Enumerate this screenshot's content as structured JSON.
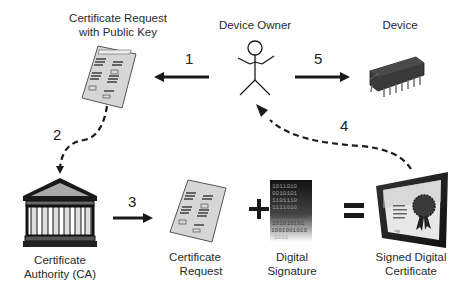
{
  "diagram": {
    "nodes": {
      "cert_request_pubkey": {
        "label_line1": "Certificate Request",
        "label_line2": "with Public Key",
        "icon": "document-form-icon"
      },
      "device_owner": {
        "label": "Device Owner",
        "icon": "stick-figure-icon"
      },
      "device": {
        "label": "Device",
        "icon": "microchip-icon"
      },
      "ca": {
        "label_line1": "Certificate",
        "label_line2": "Authority (CA)",
        "icon": "bank-building-icon"
      },
      "cert_request": {
        "label_line1": "Certificate",
        "label_line2": "Request",
        "icon": "document-form-icon"
      },
      "digital_signature": {
        "label_line1": "Digital",
        "label_line2": "Signature",
        "icon": "binary-data-icon"
      },
      "signed_cert": {
        "label_line1": "Signed Digital",
        "label_line2": "Certificate",
        "icon": "framed-certificate-icon"
      }
    },
    "steps": [
      {
        "number": "1",
        "from": "Device Owner",
        "to": "Certificate Request with Public Key",
        "style": "solid"
      },
      {
        "number": "2",
        "from": "Certificate Request with Public Key",
        "to": "Certificate Authority (CA)",
        "style": "dashed"
      },
      {
        "number": "3",
        "from": "Certificate Authority (CA)",
        "to": "Certificate Request",
        "style": "solid"
      },
      {
        "number": "4",
        "from": "Signed Digital Certificate",
        "to": "Device Owner",
        "style": "dashed"
      },
      {
        "number": "5",
        "from": "Device Owner",
        "to": "Device",
        "style": "solid"
      }
    ],
    "operators": {
      "plus": "+",
      "equals": "="
    },
    "binary_text": [
      "1011010",
      "0010101",
      "1101110",
      "1111010",
      "1100005000",
      "101010101",
      "1001001010",
      "1010"
    ]
  }
}
